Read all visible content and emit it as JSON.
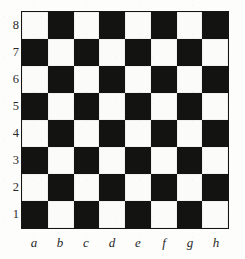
{
  "figure": {
    "name": "chessboard-diagram",
    "background_color": "#fdfdfc",
    "light_square_color": "#fbfbfa",
    "dark_square_color": "#131311",
    "border_color": "#141412"
  },
  "board": {
    "files": [
      "a",
      "b",
      "c",
      "d",
      "e",
      "f",
      "g",
      "h"
    ],
    "ranks": [
      "8",
      "7",
      "6",
      "5",
      "4",
      "3",
      "2",
      "1"
    ],
    "rows": [
      {
        "rank": "8",
        "squares": [
          {
            "id": "a8",
            "shade": "light"
          },
          {
            "id": "b8",
            "shade": "dark"
          },
          {
            "id": "c8",
            "shade": "light"
          },
          {
            "id": "d8",
            "shade": "dark"
          },
          {
            "id": "e8",
            "shade": "light"
          },
          {
            "id": "f8",
            "shade": "dark"
          },
          {
            "id": "g8",
            "shade": "light"
          },
          {
            "id": "h8",
            "shade": "dark"
          }
        ]
      },
      {
        "rank": "7",
        "squares": [
          {
            "id": "a7",
            "shade": "dark"
          },
          {
            "id": "b7",
            "shade": "light"
          },
          {
            "id": "c7",
            "shade": "dark"
          },
          {
            "id": "d7",
            "shade": "light"
          },
          {
            "id": "e7",
            "shade": "dark"
          },
          {
            "id": "f7",
            "shade": "light"
          },
          {
            "id": "g7",
            "shade": "dark"
          },
          {
            "id": "h7",
            "shade": "light"
          }
        ]
      },
      {
        "rank": "6",
        "squares": [
          {
            "id": "a6",
            "shade": "light"
          },
          {
            "id": "b6",
            "shade": "dark"
          },
          {
            "id": "c6",
            "shade": "light"
          },
          {
            "id": "d6",
            "shade": "dark"
          },
          {
            "id": "e6",
            "shade": "light"
          },
          {
            "id": "f6",
            "shade": "dark"
          },
          {
            "id": "g6",
            "shade": "light"
          },
          {
            "id": "h6",
            "shade": "dark"
          }
        ]
      },
      {
        "rank": "5",
        "squares": [
          {
            "id": "a5",
            "shade": "dark"
          },
          {
            "id": "b5",
            "shade": "light"
          },
          {
            "id": "c5",
            "shade": "dark"
          },
          {
            "id": "d5",
            "shade": "light"
          },
          {
            "id": "e5",
            "shade": "dark"
          },
          {
            "id": "f5",
            "shade": "light"
          },
          {
            "id": "g5",
            "shade": "dark"
          },
          {
            "id": "h5",
            "shade": "light"
          }
        ]
      },
      {
        "rank": "4",
        "squares": [
          {
            "id": "a4",
            "shade": "light"
          },
          {
            "id": "b4",
            "shade": "dark"
          },
          {
            "id": "c4",
            "shade": "light"
          },
          {
            "id": "d4",
            "shade": "dark"
          },
          {
            "id": "e4",
            "shade": "light"
          },
          {
            "id": "f4",
            "shade": "dark"
          },
          {
            "id": "g4",
            "shade": "light"
          },
          {
            "id": "h4",
            "shade": "dark"
          }
        ]
      },
      {
        "rank": "3",
        "squares": [
          {
            "id": "a3",
            "shade": "dark"
          },
          {
            "id": "b3",
            "shade": "light"
          },
          {
            "id": "c3",
            "shade": "dark"
          },
          {
            "id": "d3",
            "shade": "light"
          },
          {
            "id": "e3",
            "shade": "dark"
          },
          {
            "id": "f3",
            "shade": "light"
          },
          {
            "id": "g3",
            "shade": "dark"
          },
          {
            "id": "h3",
            "shade": "light"
          }
        ]
      },
      {
        "rank": "2",
        "squares": [
          {
            "id": "a2",
            "shade": "light"
          },
          {
            "id": "b2",
            "shade": "dark"
          },
          {
            "id": "c2",
            "shade": "light"
          },
          {
            "id": "d2",
            "shade": "dark"
          },
          {
            "id": "e2",
            "shade": "light"
          },
          {
            "id": "f2",
            "shade": "dark"
          },
          {
            "id": "g2",
            "shade": "light"
          },
          {
            "id": "h2",
            "shade": "dark"
          }
        ]
      },
      {
        "rank": "1",
        "squares": [
          {
            "id": "a1",
            "shade": "dark"
          },
          {
            "id": "b1",
            "shade": "light"
          },
          {
            "id": "c1",
            "shade": "dark"
          },
          {
            "id": "d1",
            "shade": "light"
          },
          {
            "id": "e1",
            "shade": "dark"
          },
          {
            "id": "f1",
            "shade": "light"
          },
          {
            "id": "g1",
            "shade": "dark"
          },
          {
            "id": "h1",
            "shade": "light"
          }
        ]
      }
    ]
  }
}
